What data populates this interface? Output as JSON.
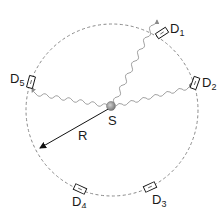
{
  "diagram": {
    "title": "",
    "source": {
      "label": "S",
      "color": "#9a9a9a"
    },
    "radius": {
      "label": "R"
    },
    "circle": {
      "style": "dashed",
      "color": "#8a8a8a"
    },
    "detectors": [
      {
        "id": "D1",
        "main": "D",
        "sub": "1"
      },
      {
        "id": "D2",
        "main": "D",
        "sub": "2"
      },
      {
        "id": "D3",
        "main": "D",
        "sub": "3"
      },
      {
        "id": "D4",
        "main": "D",
        "sub": "4"
      },
      {
        "id": "D5",
        "main": "D",
        "sub": "5"
      }
    ],
    "paths": [
      {
        "from": "S",
        "to": "D1",
        "style": "wavy"
      },
      {
        "from": "S",
        "to": "D2",
        "style": "wavy"
      },
      {
        "from": "S",
        "to": "D5",
        "style": "wavy"
      }
    ]
  }
}
